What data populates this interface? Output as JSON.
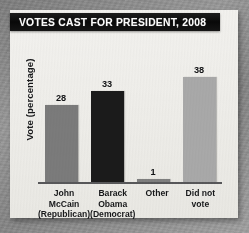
{
  "card": {
    "title": "VOTES CAST FOR PRESIDENT, 2008",
    "title_bar_color": "#0a0a0a",
    "title_text_color": "#fbfbfb",
    "background_color": "#f1f0ec"
  },
  "chart_data": {
    "type": "bar",
    "title": "VOTES CAST FOR PRESIDENT, 2008",
    "subtitle": "",
    "xlabel": "",
    "ylabel": "Vote (percentage)",
    "categories": [
      "John McCain (Republican)",
      "Barack Obama (Democrat)",
      "Other",
      "Did not vote"
    ],
    "category_lines": [
      [
        "John",
        "McCain",
        "(Republican)"
      ],
      [
        "Barack",
        "Obama",
        "(Democrat)"
      ],
      [
        "Other"
      ],
      [
        "Did not",
        "vote"
      ]
    ],
    "values": [
      28,
      33,
      1,
      38
    ],
    "data_labels": [
      "28",
      "33",
      "1",
      "38"
    ],
    "bar_colors": [
      "#7b7b7b",
      "#1b1b1b",
      "#7f7f7f",
      "#a9a9a9"
    ],
    "ylim": [
      0,
      40
    ],
    "grid": false,
    "legend": "none",
    "axis_color": "#58585a",
    "value_label_color": "#111214",
    "tick_label_color": "#17181a"
  }
}
